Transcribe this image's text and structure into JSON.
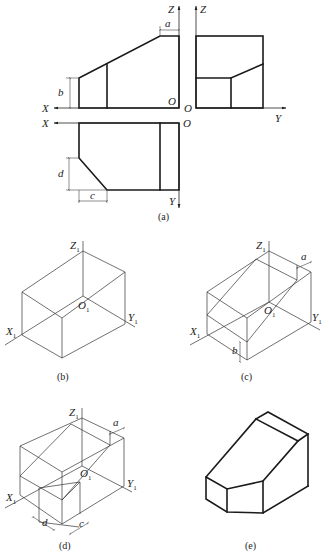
{
  "figure": {
    "panels": [
      {
        "id": "a",
        "caption": "(a)",
        "description": "Three orthographic views (front, side, top) of a chamfered block"
      },
      {
        "id": "b",
        "caption": "(b)",
        "description": "Isometric bounding box"
      },
      {
        "id": "c",
        "caption": "(c)",
        "description": "Isometric box with slanted cut defined by a and b"
      },
      {
        "id": "d",
        "caption": "(d)",
        "description": "Isometric box with corner cut defined by c and d"
      },
      {
        "id": "e",
        "caption": "(e)",
        "description": "Finished isometric solid"
      }
    ],
    "axis_labels": {
      "X": "X",
      "Y": "Y",
      "Z": "Z",
      "O": "O",
      "X1": "X",
      "Y1": "Y",
      "Z1": "Z",
      "O1": "O",
      "sub1": "1"
    },
    "dimensions": {
      "a": "a",
      "b": "b",
      "c": "c",
      "d": "d"
    },
    "colors": {
      "line": "#1a1a1a",
      "background": "#ffffff"
    }
  }
}
